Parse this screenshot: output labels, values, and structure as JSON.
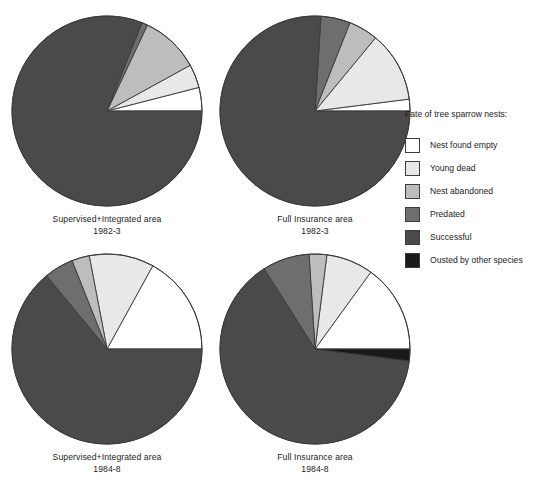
{
  "legend": {
    "title": "Fate of tree sparrow nests:",
    "items": [
      {
        "label": "Nest found empty",
        "key": "empty",
        "color": "#ffffff"
      },
      {
        "label": "Young dead",
        "key": "young_dead",
        "color": "#e8e8e8"
      },
      {
        "label": "Nest abandoned",
        "key": "abandoned",
        "color": "#bdbdbd"
      },
      {
        "label": "Predated",
        "key": "predated",
        "color": "#6e6e6e"
      },
      {
        "label": "Successful",
        "key": "successful",
        "color": "#4a4a4a"
      },
      {
        "label": "Ousted by other species",
        "key": "ousted",
        "color": "#1a1a1a"
      }
    ]
  },
  "chart_data": {
    "type": "pie",
    "title": "Fate of tree sparrow nests",
    "legend_position": "right",
    "categories": [
      "Nest found empty",
      "Young dead",
      "Nest abandoned",
      "Predated",
      "Successful",
      "Ousted by other species"
    ],
    "colors": [
      "#ffffff",
      "#e8e8e8",
      "#bdbdbd",
      "#6e6e6e",
      "#4a4a4a",
      "#1a1a1a"
    ],
    "units": "percent",
    "start_angle_deg": 0,
    "direction": "counterclockwise",
    "panels": [
      {
        "id": "supervised-1982-3",
        "area": "Supervised+Integrated area",
        "period": "1982-3",
        "position": "top-left",
        "values": [
          4,
          4,
          10,
          1,
          81,
          0
        ]
      },
      {
        "id": "full-insurance-1982-3",
        "area": "Full Insurance area",
        "period": "1982-3",
        "position": "top-right",
        "values": [
          2,
          12,
          5,
          5,
          76,
          0
        ]
      },
      {
        "id": "supervised-1984-8",
        "area": "Supervised+Integrated area",
        "period": "1984-8",
        "position": "bottom-left",
        "values": [
          17,
          11,
          3,
          5,
          64,
          0
        ]
      },
      {
        "id": "full-insurance-1984-8",
        "area": "Full Insurance area",
        "period": "1984-8",
        "position": "bottom-right",
        "values": [
          15,
          8,
          3,
          8,
          64,
          2
        ]
      }
    ]
  },
  "panels": {
    "top_left": {
      "line1": "Supervised+Integrated area",
      "line2": "1982-3"
    },
    "top_right": {
      "line1": "Full Insurance area",
      "line2": "1982-3"
    },
    "bottom_left": {
      "line1": "Supervised+Integrated area",
      "line2": "1984-8"
    },
    "bottom_right": {
      "line1": "Full Insurance area",
      "line2": "1984-8"
    }
  }
}
